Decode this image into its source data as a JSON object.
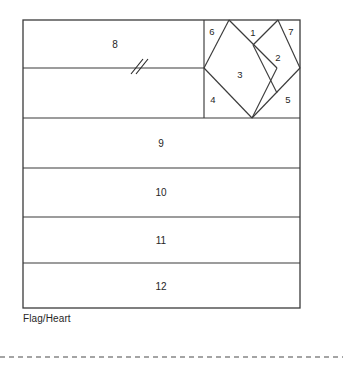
{
  "diagram": {
    "title": "Flag/Heart",
    "caption": "Flag/Heart",
    "type": "quilt-block-piecing-diagram",
    "colors": {
      "line": "#3b3b3b",
      "background": "#ffffff",
      "text": "#262626",
      "rule": "#4a4a4a"
    },
    "frame": {
      "x": 23,
      "y": 20,
      "width": 277,
      "height": 288
    },
    "heart_block": {
      "x": 204,
      "y": 20,
      "width": 96,
      "height": 98,
      "left_apex_x": 229,
      "right_apex_x": 278,
      "mid_y": 68,
      "bottom_point_x": 252,
      "bottom_point_y": 118
    },
    "break_mark": {
      "label": "double-slash-break",
      "x": 137,
      "y": 68
    },
    "pieces": [
      {
        "id": "1",
        "label": "1",
        "cx": 253,
        "cy": 33,
        "shape": "triangle",
        "region": "heart-top-center"
      },
      {
        "id": "2",
        "label": "2",
        "cx": 277,
        "cy": 57,
        "shape": "triangle",
        "region": "heart-right-inner"
      },
      {
        "id": "3",
        "label": "3",
        "cx": 240,
        "cy": 74,
        "shape": "square-on-point",
        "region": "heart-center"
      },
      {
        "id": "4",
        "label": "4",
        "cx": 213,
        "cy": 99,
        "shape": "corner-triangle",
        "region": "heart-bottom-left"
      },
      {
        "id": "5",
        "label": "5",
        "cx": 288,
        "cy": 99,
        "shape": "corner-triangle",
        "region": "heart-bottom-right"
      },
      {
        "id": "6",
        "label": "6",
        "cx": 212,
        "cy": 31,
        "shape": "corner-triangle",
        "region": "heart-top-left"
      },
      {
        "id": "7",
        "label": "7",
        "cx": 291,
        "cy": 31,
        "shape": "corner-triangle",
        "region": "heart-top-right"
      },
      {
        "id": "8",
        "label": "8",
        "cx": 115,
        "cy": 44,
        "shape": "rectangle",
        "region": "flag-upper-band"
      },
      {
        "id": "9",
        "label": "9",
        "cx": 161,
        "cy": 143,
        "shape": "rectangle",
        "region": "flag-stripe-1"
      },
      {
        "id": "10",
        "label": "10",
        "cx": 161,
        "cy": 192,
        "shape": "rectangle",
        "region": "flag-stripe-2"
      },
      {
        "id": "11",
        "label": "11",
        "cx": 161,
        "cy": 240,
        "shape": "rectangle",
        "region": "flag-stripe-3"
      },
      {
        "id": "12",
        "label": "12",
        "cx": 161,
        "cy": 286,
        "shape": "rectangle",
        "region": "flag-stripe-4"
      }
    ],
    "divider_rows_y": [
      118,
      168,
      217,
      263
    ],
    "footer_rule_y": 357
  }
}
